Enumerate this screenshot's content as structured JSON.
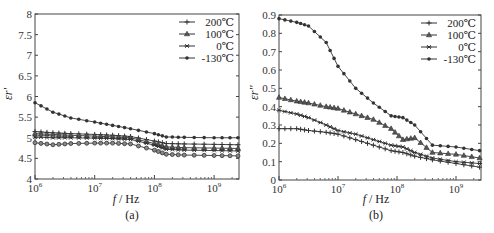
{
  "chart_data": [
    {
      "id": "a",
      "type": "line",
      "title": "",
      "caption": "(a)",
      "xlabel": "f / Hz",
      "ylabel": "εr'",
      "xscale": "log",
      "xlim_log10": [
        6,
        9.42
      ],
      "ylim": [
        4,
        8
      ],
      "xticks": [
        "10^6",
        "10^7",
        "10^8",
        "10^9"
      ],
      "yticks": [
        "4",
        "4.5",
        "5",
        "5.5",
        "6",
        "6.5",
        "7",
        "7.5",
        "8"
      ],
      "grid": false,
      "legend_position": "upper right",
      "x_log10": [
        6.0,
        6.3,
        6.6,
        7.0,
        7.3,
        7.6,
        8.0,
        8.2,
        8.5,
        9.0,
        9.4
      ],
      "series": [
        {
          "name": "200℃",
          "marker": "plus",
          "values": [
            5.15,
            5.12,
            5.1,
            5.08,
            5.06,
            5.03,
            4.92,
            4.86,
            4.85,
            4.84,
            4.83
          ]
        },
        {
          "name": "100℃",
          "marker": "triangle",
          "values": [
            5.1,
            5.08,
            5.06,
            5.04,
            5.02,
            5.0,
            4.86,
            4.78,
            4.76,
            4.75,
            4.74
          ]
        },
        {
          "name": "0℃",
          "marker": "star",
          "values": [
            5.02,
            5.0,
            5.0,
            4.99,
            4.98,
            4.96,
            4.82,
            4.72,
            4.7,
            4.69,
            4.68
          ]
        },
        {
          "name": "-130℃",
          "marker": "dot",
          "values": [
            5.85,
            5.62,
            5.48,
            5.38,
            5.3,
            5.22,
            5.1,
            5.02,
            5.01,
            5.0,
            5.0
          ]
        },
        {
          "name": "",
          "marker": "circle",
          "values": [
            4.88,
            4.83,
            4.86,
            4.87,
            4.87,
            4.85,
            4.7,
            4.6,
            4.58,
            4.57,
            4.56
          ]
        }
      ]
    },
    {
      "id": "b",
      "type": "line",
      "title": "",
      "caption": "(b)",
      "xlabel": "f / Hz",
      "ylabel": "εr''",
      "xscale": "log",
      "xlim_log10": [
        6,
        9.42
      ],
      "ylim": [
        0,
        0.9
      ],
      "xticks": [
        "10^6",
        "10^7",
        "10^8",
        "10^9"
      ],
      "yticks": [
        "0",
        "0.1",
        "0.2",
        "0.3",
        "0.4",
        "0.5",
        "0.6",
        "0.7",
        "0.8",
        "0.9"
      ],
      "grid": false,
      "legend_position": "upper right",
      "x_log10": [
        6.0,
        6.3,
        6.5,
        6.8,
        7.0,
        7.3,
        7.6,
        7.9,
        8.1,
        8.3,
        8.6,
        9.0,
        9.4
      ],
      "series": [
        {
          "name": "200℃",
          "marker": "plus",
          "values": [
            0.28,
            0.28,
            0.27,
            0.26,
            0.25,
            0.22,
            0.19,
            0.16,
            0.15,
            0.13,
            0.11,
            0.09,
            0.07
          ]
        },
        {
          "name": "100℃",
          "marker": "triangle",
          "values": [
            0.45,
            0.43,
            0.42,
            0.4,
            0.39,
            0.36,
            0.33,
            0.28,
            0.22,
            0.23,
            0.15,
            0.14,
            0.12
          ]
        },
        {
          "name": "0℃",
          "marker": "star",
          "values": [
            0.38,
            0.36,
            0.34,
            0.3,
            0.27,
            0.25,
            0.22,
            0.19,
            0.18,
            0.15,
            0.12,
            0.1,
            0.09
          ]
        },
        {
          "name": "-130℃",
          "marker": "dot",
          "values": [
            0.88,
            0.86,
            0.84,
            0.75,
            0.62,
            0.5,
            0.42,
            0.35,
            0.34,
            0.3,
            0.19,
            0.18,
            0.16
          ]
        }
      ]
    }
  ],
  "legend": [
    "200℃",
    "100℃",
    "0℃",
    "-130℃"
  ],
  "labels": {
    "a_caption": "(a)",
    "b_caption": "(b)",
    "xlabel_f": "f",
    "xlabel_unit": " / Hz",
    "a_ylabel": "εr'",
    "b_ylabel": "εr''"
  }
}
